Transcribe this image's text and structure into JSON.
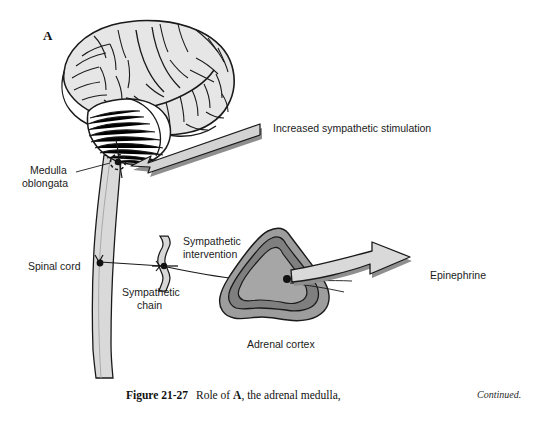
{
  "figure": {
    "panel_letter": "A",
    "labels": {
      "increased_sympathetic_stimulation": "Increased sympathetic stimulation",
      "medulla_oblongata_line1": "Medulla",
      "medulla_oblongata_line2": "oblongata",
      "spinal_cord": "Spinal cord",
      "sympathetic_chain_line1": "Sympathetic",
      "sympathetic_chain_line2": "chain",
      "sympathetic_intervention_line1": "Sympathetic",
      "sympathetic_intervention_line2": "intervention",
      "adrenal_cortex": "Adrenal cortex",
      "epinephrine": "Epinephrine"
    },
    "caption": {
      "figure_number": "Figure 21-27",
      "text_before_bold": "Role of ",
      "bold_part": "A",
      "text_after_bold": ", the adrenal medulla,",
      "continued": "Continued."
    },
    "colors": {
      "background": "#ffffff",
      "outline": "#1a1a1a",
      "brain_fill": "#e2e2e2",
      "spinal_cord_fill": "#d9d9d9",
      "arrow_fill": "#d0d0d0",
      "arrow_shadow": "#8c8c8c",
      "adrenal_outer": "#9b9b9b",
      "adrenal_inner": "#8a8a8a",
      "adrenal_core": "#a8a8a8",
      "text": "#1b1b1b"
    },
    "icon_names": [
      "brain-icon",
      "cerebellum-icon",
      "spinal-cord-icon",
      "sympathetic-chain-ganglion-icon",
      "adrenal-gland-icon",
      "stimulation-arrow-icon",
      "epinephrine-arrow-icon"
    ]
  }
}
